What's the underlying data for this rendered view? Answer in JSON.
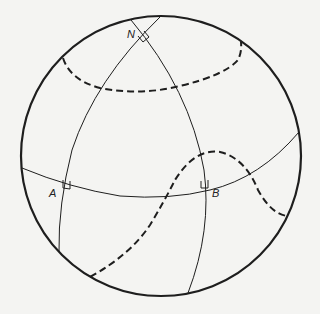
{
  "diagram": {
    "title": "",
    "labels": {
      "N": "N",
      "A": "A",
      "B": "B"
    },
    "colors": {
      "background": "#f4f4f2",
      "stroke": "#1e1e1e"
    },
    "elements": [
      {
        "name": "sphere-outline",
        "type": "circle"
      },
      {
        "name": "equator-great-circle",
        "type": "solid-curve"
      },
      {
        "name": "meridian-through-A",
        "type": "solid-curve"
      },
      {
        "name": "meridian-through-B",
        "type": "solid-curve"
      },
      {
        "name": "upper-dashed-curve",
        "type": "dashed-curve"
      },
      {
        "name": "wavy-dashed-curve",
        "type": "dashed-curve"
      },
      {
        "name": "right-angle-at-N",
        "type": "marker"
      },
      {
        "name": "right-angle-at-A",
        "type": "marker"
      },
      {
        "name": "right-angle-at-B",
        "type": "marker"
      }
    ]
  }
}
